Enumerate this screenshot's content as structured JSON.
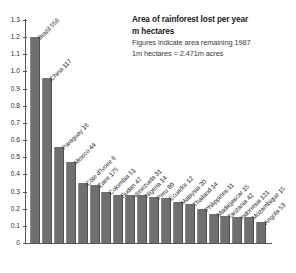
{
  "title": {
    "line1": "Area of rainforest lost per year",
    "line2": "m hectares",
    "note1": "Figures indicate area remaining 1987",
    "note2": "1m hectares = 2.471m acres"
  },
  "colors": {
    "bar": "#6f6f6f",
    "axis": "#555555",
    "text": "#2b2b2b",
    "background": "#ffffff"
  },
  "chart_data": {
    "type": "bar",
    "title": "Area of rainforest lost per year",
    "subtitle": "m hectares",
    "annotations": [
      "Figures indicate area remaining 1987",
      "1m hectares = 2.471m acres"
    ],
    "xlabel": "",
    "ylabel": "m hectares",
    "ylim": [
      0,
      1.3
    ],
    "grid": false,
    "legend": "none",
    "ytick_labels": [
      "0",
      "0.1",
      "0.2",
      "0.3",
      "0.4",
      "0.5",
      "0.6",
      "0.7",
      "0.8",
      "0.9",
      "1.0",
      "1.1",
      "1.2",
      "1.3"
    ],
    "yticks": [
      0,
      0.1,
      0.2,
      0.3,
      0.4,
      0.5,
      0.6,
      0.7,
      0.8,
      0.9,
      1.0,
      1.1,
      1.2,
      1.3
    ],
    "categories": [
      "Brazil 556",
      "China 117",
      "Paraguay 16",
      "Mexico 44",
      "Côte d'Ivoire 6",
      "Zaire 175",
      "Colombia 51",
      "Sudan 47",
      "Venezuela 31",
      "Nigeria 14",
      "Peru 89",
      "Ecuador 12",
      "Malaysia 20",
      "Thailand 14",
      "Philippines 11",
      "Madagascar 15",
      "Tanzania 42",
      "Indonesia 121",
      "Mozambique 15",
      "Angola 53"
    ],
    "values": [
      1.2,
      0.96,
      0.56,
      0.47,
      0.35,
      0.34,
      0.3,
      0.28,
      0.28,
      0.28,
      0.27,
      0.26,
      0.24,
      0.23,
      0.2,
      0.17,
      0.16,
      0.15,
      0.15,
      0.12
    ],
    "remaining_1987": [
      556,
      117,
      16,
      44,
      6,
      175,
      51,
      47,
      31,
      14,
      89,
      12,
      20,
      14,
      11,
      15,
      42,
      121,
      15,
      53
    ]
  }
}
